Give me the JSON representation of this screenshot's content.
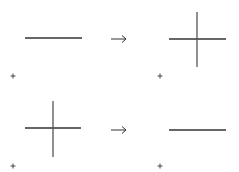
{
  "diagram": {
    "stroke_color": "#333333",
    "cross_stroke_color": "#555555",
    "rows": [
      {
        "left": {
          "shape": "line",
          "h": {
            "x1": 25,
            "x2": 82,
            "y": 38
          },
          "origin_marker": {
            "x": 13,
            "y": 76,
            "symbol": "+"
          }
        },
        "arrow": {
          "x1": 111,
          "x2": 126,
          "y": 39,
          "symbol": "→"
        },
        "right": {
          "shape": "cross",
          "h": {
            "x1": 169,
            "x2": 226,
            "y": 39
          },
          "v": {
            "x": 197,
            "y1": 12,
            "y2": 67
          },
          "origin_marker": {
            "x": 160,
            "y": 76,
            "symbol": "+"
          }
        }
      },
      {
        "left": {
          "shape": "cross",
          "h": {
            "x1": 25,
            "x2": 81,
            "y": 128
          },
          "v": {
            "x": 53,
            "y1": 101,
            "y2": 157
          },
          "origin_marker": {
            "x": 13,
            "y": 166,
            "symbol": "+"
          }
        },
        "arrow": {
          "x1": 111,
          "x2": 126,
          "y": 130,
          "symbol": "→"
        },
        "right": {
          "shape": "line",
          "h": {
            "x1": 169,
            "x2": 226,
            "y": 130
          },
          "origin_marker": {
            "x": 160,
            "y": 166,
            "symbol": "+"
          }
        }
      }
    ]
  }
}
